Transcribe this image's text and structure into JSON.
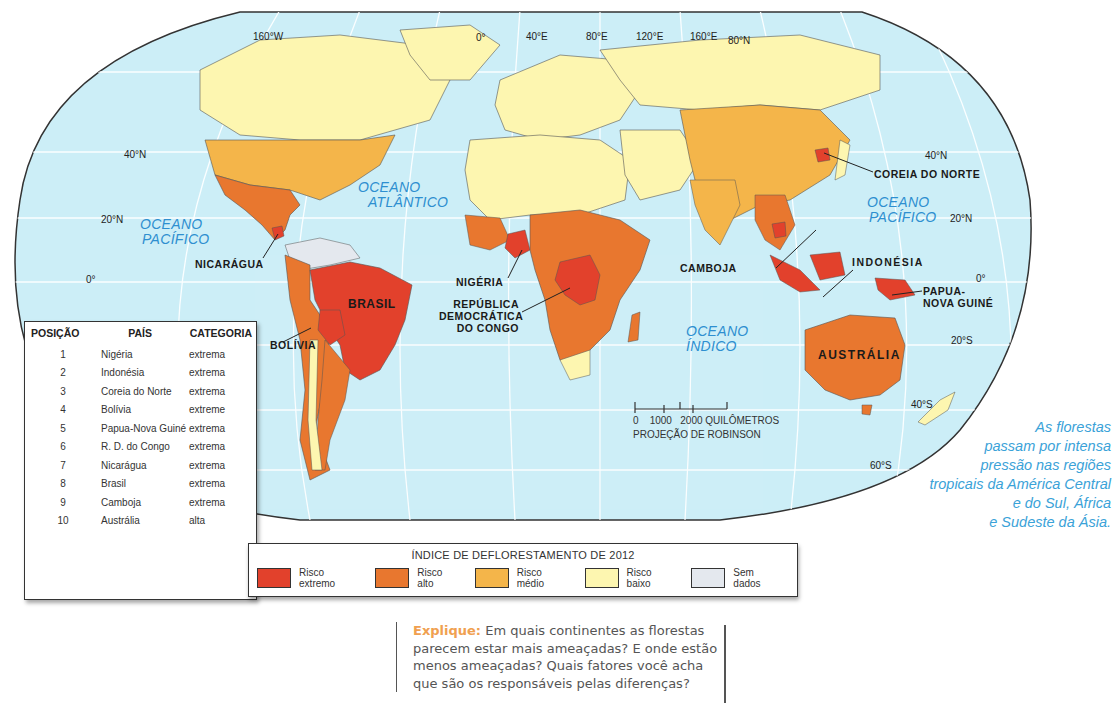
{
  "map": {
    "projection_label": "PROJEÇÃO DE ROBINSON",
    "scale": {
      "ticks": [
        "0",
        "1000",
        "2000"
      ],
      "unit": "QUILÔMETROS"
    },
    "graticule_labels": {
      "longitude": [
        "160°W",
        "0°",
        "40°E",
        "80°E",
        "120°E",
        "160°E"
      ],
      "latitude_left": [
        "40°N",
        "20°N",
        "0°"
      ],
      "latitude_right": [
        "80°N",
        "40°N",
        "20°N",
        "0°",
        "20°S",
        "40°S",
        "60°S"
      ]
    },
    "oceans": {
      "pacific_west": [
        "OCEANO",
        "PACÍFICO"
      ],
      "atlantic": [
        "OCEANO",
        "ATLÂNTICO"
      ],
      "indian": [
        "OCEANO",
        "ÍNDICO"
      ],
      "pacific_east": [
        "OCEANO",
        "PACÍFICO"
      ]
    },
    "country_labels": {
      "nicaragua": "NICARÁGUA",
      "brasil": "BRASIL",
      "bolivia": "BOLÍVIA",
      "nigeria": "NIGÉRIA",
      "rdc": [
        "REPÚBLICA",
        "DEMOCRÁTICA",
        "DO CONGO"
      ],
      "camboja": "CAMBOJA",
      "coreia": "COREIA DO NORTE",
      "indonesia": "INDONÉSIA",
      "papua": [
        "PAPUA-",
        "NOVA GUINÉ"
      ],
      "australia": "AUSTRÁLIA"
    },
    "colors": {
      "ocean": "#cdeef7",
      "grid": "#ffffff",
      "border": "#333333"
    }
  },
  "ranking_table": {
    "headers": {
      "position": "POSIÇÃO",
      "country": "PAÍS",
      "category": "CATEGORIA"
    },
    "rows": [
      {
        "position": "1",
        "country": "Nigéria",
        "category": "extrema"
      },
      {
        "position": "2",
        "country": "Indonésia",
        "category": "extrema"
      },
      {
        "position": "3",
        "country": "Coreia do Norte",
        "category": "extrema"
      },
      {
        "position": "4",
        "country": "Bolívia",
        "category": "extreme"
      },
      {
        "position": "5",
        "country": "Papua-Nova Guiné",
        "category": "extrema"
      },
      {
        "position": "6",
        "country": "R. D. do Congo",
        "category": "extrema"
      },
      {
        "position": "7",
        "country": "Nicarágua",
        "category": "extrema"
      },
      {
        "position": "8",
        "country": "Brasil",
        "category": "extrema"
      },
      {
        "position": "9",
        "country": "Camboja",
        "category": "extrema"
      },
      {
        "position": "10",
        "country": "Austrália",
        "category": "alta"
      }
    ]
  },
  "legend": {
    "title": "ÍNDICE DE DEFLORESTAMENTO DE 2012",
    "items": [
      {
        "label": "Risco extremo",
        "color": "#e2412c"
      },
      {
        "label": "Risco alto",
        "color": "#e8772f"
      },
      {
        "label": "Risco médio",
        "color": "#f4b54a"
      },
      {
        "label": "Risco baixo",
        "color": "#fdf6b0"
      },
      {
        "label": "Sem dados",
        "color": "#e4e8ee"
      }
    ]
  },
  "caption": {
    "lines": [
      "As florestas",
      "passam por intensa",
      "pressão nas regiões",
      "tropicais da América Central",
      "e do Sul, África",
      "e Sudeste da Ásia."
    ],
    "color": "#3aa2d8"
  },
  "explique": {
    "keyword": "Explique:",
    "text": " Em quais continentes as florestas parecem estar mais ameaçadas? E onde estão menos ameaçadas? Quais fatores você acha que são os responsáveis pelas diferenças?",
    "keyword_color": "#f0a050"
  }
}
